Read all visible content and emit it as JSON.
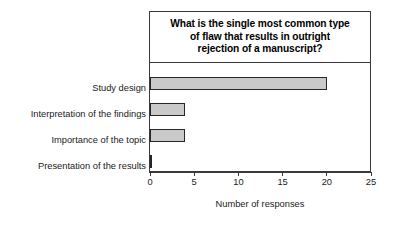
{
  "chart_data": {
    "type": "bar",
    "orientation": "horizontal",
    "title": "What is the single most common type\nof flaw that results in outright\nrejection of a manuscript?",
    "title_lines": [
      "What is the single most common type",
      "of flaw that results in outright",
      "rejection of a manuscript?"
    ],
    "categories": [
      "Study design",
      "Interpretation of the findings",
      "Importance of the topic",
      "Presentation of the results"
    ],
    "values": [
      20,
      4,
      4,
      0.2
    ],
    "xlabel": "Number of responses",
    "ylabel": "",
    "xlim": [
      0,
      25
    ],
    "xticks": [
      0,
      5,
      10,
      15,
      20,
      25
    ],
    "xtick_labels": [
      "0",
      "5",
      "10",
      "15",
      "20",
      "25"
    ],
    "grid": false,
    "legend": false,
    "bar_fill_color": "#c9c9c9",
    "bar_edge_color": "#262626",
    "axis_color": "#3a3a3a",
    "background_color": "#ffffff"
  }
}
